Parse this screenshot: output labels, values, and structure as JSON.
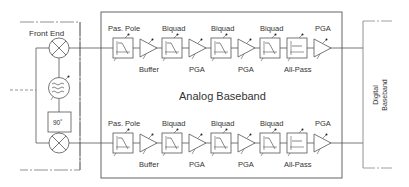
{
  "diagram": {
    "front_end": {
      "label": "Front End",
      "phase_shift_label": "90˚"
    },
    "analog_baseband": {
      "label": "Analog Baseband"
    },
    "digital_baseband": {
      "line1": "Digital",
      "line2": "Baseband"
    },
    "top_chain": {
      "labels_above": [
        "Pas. Pole",
        "Biquad",
        "Biquad",
        "Biquad",
        "PGA"
      ],
      "labels_below": [
        "Buffer",
        "PGA",
        "PGA",
        "All-Pass"
      ]
    },
    "bottom_chain": {
      "labels_above": [
        "Pas. Pole",
        "Biquad",
        "Biquad",
        "Biquad",
        "PGA"
      ],
      "labels_below": [
        "Buffer",
        "PGA",
        "PGA",
        "All-Pass"
      ]
    },
    "colors": {
      "line": "#555555",
      "text": "#333333",
      "background": "#ffffff"
    }
  }
}
